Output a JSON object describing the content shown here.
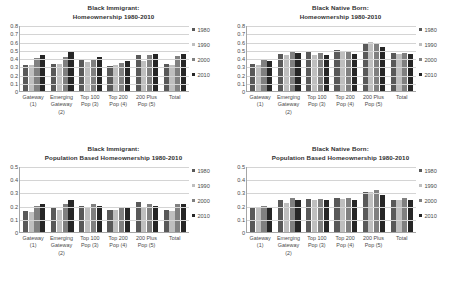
{
  "figure": {
    "series_names": [
      "1980",
      "1990",
      "2000",
      "2010"
    ],
    "series_colors": [
      "#595959",
      "#bfbfbf",
      "#808080",
      "#262626"
    ],
    "categories": [
      {
        "l1": "Gateway",
        "l2": "(1)",
        "l3": ""
      },
      {
        "l1": "Emerging",
        "l2": "Gateway",
        "l3": "(2)"
      },
      {
        "l1": "Top 100",
        "l2": "Pop (3)",
        "l3": ""
      },
      {
        "l1": "Top 200",
        "l2": "Pop (4)",
        "l3": ""
      },
      {
        "l1": "200 Plus",
        "l2": "Pop (5)",
        "l3": ""
      },
      {
        "l1": "Total",
        "l2": "",
        "l3": ""
      }
    ]
  },
  "chart_data": [
    {
      "type": "bar",
      "panel": "top-left",
      "title_line1": "Black Immigrant:",
      "title_line2": "Homeownership 1980-2010",
      "xlabel": "",
      "ylabel": "",
      "ylim": [
        0,
        0.8
      ],
      "yticks": [
        "0",
        "0.1",
        "0.2",
        "0.3",
        "0.4",
        "0.5",
        "0.6",
        "0.7",
        "0.8"
      ],
      "grid": true,
      "legend_position": "right",
      "categories": [
        "Gateway (1)",
        "Emerging Gateway (2)",
        "Top 100 Pop (3)",
        "Top 200 Pop (4)",
        "200 Plus Pop (5)",
        "Total"
      ],
      "series": [
        {
          "name": "1980",
          "values": [
            0.31,
            0.33,
            0.37,
            0.3,
            0.44,
            0.33
          ]
        },
        {
          "name": "1990",
          "values": [
            0.31,
            0.33,
            0.35,
            0.31,
            0.36,
            0.32
          ]
        },
        {
          "name": "2000",
          "values": [
            0.4,
            0.41,
            0.39,
            0.34,
            0.44,
            0.43
          ]
        },
        {
          "name": "2010",
          "values": [
            0.44,
            0.49,
            0.41,
            0.36,
            0.45,
            0.45
          ]
        }
      ]
    },
    {
      "type": "bar",
      "panel": "top-right",
      "title_line1": "Black Native Born:",
      "title_line2": "Homeownership 1980-2010",
      "xlabel": "",
      "ylabel": "",
      "ylim": [
        0,
        0.8
      ],
      "yticks": [
        "0",
        "0.1",
        "0.2",
        "0.3",
        "0.4",
        "0.5",
        "0.6",
        "0.7",
        "0.8"
      ],
      "grid": true,
      "legend_position": "right",
      "categories": [
        "Gateway (1)",
        "Emerging Gateway (2)",
        "Top 100 Pop (3)",
        "Top 200 Pop (4)",
        "200 Plus Pop (5)",
        "Total"
      ],
      "series": [
        {
          "name": "1980",
          "values": [
            0.33,
            0.45,
            0.48,
            0.5,
            0.58,
            0.46
          ]
        },
        {
          "name": "1990",
          "values": [
            0.32,
            0.44,
            0.44,
            0.47,
            0.59,
            0.45
          ]
        },
        {
          "name": "2000",
          "values": [
            0.37,
            0.47,
            0.46,
            0.47,
            0.57,
            0.46
          ]
        },
        {
          "name": "2010",
          "values": [
            0.36,
            0.46,
            0.44,
            0.45,
            0.53,
            0.45
          ]
        }
      ]
    },
    {
      "type": "bar",
      "panel": "bottom-left",
      "title_line1": "Black Immigrant:",
      "title_line2": "Population Based Homeownership 1980-2010",
      "xlabel": "",
      "ylabel": "",
      "ylim": [
        0,
        0.5
      ],
      "yticks": [
        "0",
        "0.1",
        "0.2",
        "0.3",
        "0.4",
        "0.5"
      ],
      "grid": true,
      "legend_position": "right",
      "categories": [
        "Gateway (1)",
        "Emerging Gateway (2)",
        "Top 100 Pop (3)",
        "Top 200 Pop (4)",
        "200 Plus Pop (5)",
        "Total"
      ],
      "series": [
        {
          "name": "1980",
          "values": [
            0.16,
            0.18,
            0.2,
            0.17,
            0.23,
            0.17
          ]
        },
        {
          "name": "1990",
          "values": [
            0.15,
            0.17,
            0.19,
            0.17,
            0.19,
            0.16
          ]
        },
        {
          "name": "2000",
          "values": [
            0.2,
            0.21,
            0.21,
            0.18,
            0.21,
            0.21
          ]
        },
        {
          "name": "2010",
          "values": [
            0.21,
            0.24,
            0.2,
            0.18,
            0.2,
            0.21
          ]
        }
      ]
    },
    {
      "type": "bar",
      "panel": "bottom-right",
      "title_line1": "Black Native Born:",
      "title_line2": "Population Based Homeownership 1980-2010",
      "xlabel": "",
      "ylabel": "",
      "ylim": [
        0,
        0.5
      ],
      "yticks": [
        "0",
        "0.1",
        "0.2",
        "0.3",
        "0.4",
        "0.5"
      ],
      "grid": true,
      "legend_position": "right",
      "categories": [
        "Gateway (1)",
        "Emerging Gateway (2)",
        "Top 100 Pop (3)",
        "Top 200 Pop (4)",
        "200 Plus Pop (5)",
        "Total"
      ],
      "series": [
        {
          "name": "1980",
          "values": [
            0.18,
            0.24,
            0.25,
            0.26,
            0.3,
            0.24
          ]
        },
        {
          "name": "1990",
          "values": [
            0.19,
            0.22,
            0.24,
            0.25,
            0.3,
            0.24
          ]
        },
        {
          "name": "2000",
          "values": [
            0.2,
            0.26,
            0.25,
            0.26,
            0.32,
            0.26
          ]
        },
        {
          "name": "2010",
          "values": [
            0.19,
            0.24,
            0.24,
            0.24,
            0.28,
            0.24
          ]
        }
      ]
    }
  ]
}
